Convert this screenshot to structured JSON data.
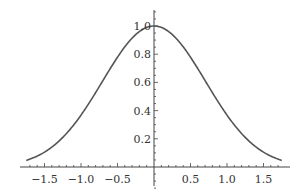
{
  "chart_data": {
    "type": "line",
    "title": "",
    "xlabel": "",
    "ylabel": "",
    "function": "exp(-x^2)",
    "xlim": [
      -1.75,
      1.75
    ],
    "ylim": [
      0,
      1.0
    ],
    "grid": false,
    "legend": null,
    "x_ticks": [
      -1.5,
      -1.0,
      -0.5,
      0.5,
      1.0,
      1.5
    ],
    "x_tick_labels": [
      "−1.5",
      "−1.0",
      "−0.5",
      "0.5",
      "1.0",
      "1.5"
    ],
    "y_ticks": [
      0.2,
      0.4,
      0.6,
      0.8,
      1.0
    ],
    "y_tick_labels": [
      "0.2",
      "0.4",
      "0.6",
      "0.8",
      "1.0"
    ],
    "series": [
      {
        "name": "curve",
        "color": "#555555",
        "x": [
          -1.75,
          -1.5,
          -1.25,
          -1.0,
          -0.75,
          -0.5,
          -0.25,
          0,
          0.25,
          0.5,
          0.75,
          1.0,
          1.25,
          1.5,
          1.75
        ],
        "values": [
          0.047,
          0.105,
          0.21,
          0.368,
          0.57,
          0.779,
          0.939,
          1.0,
          0.939,
          0.779,
          0.57,
          0.368,
          0.21,
          0.105,
          0.047
        ]
      }
    ]
  }
}
